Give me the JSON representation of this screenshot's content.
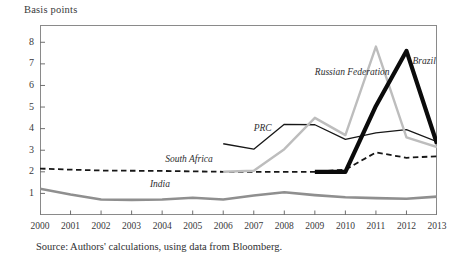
{
  "figure": {
    "y_axis_title": "Basis points",
    "source_note": "Source: Authors' calculations, using data from Bloomberg."
  },
  "chart_data": {
    "type": "line",
    "title": "",
    "subtitle": "",
    "xlabel": "",
    "ylabel": "Basis points",
    "x": [
      2000,
      2001,
      2002,
      2003,
      2004,
      2005,
      2006,
      2007,
      2008,
      2009,
      2010,
      2011,
      2012,
      2013
    ],
    "xtick_labels": [
      "2000",
      "2001",
      "2002",
      "2003",
      "2004",
      "2005",
      "2006",
      "2007",
      "2008",
      "2009",
      "2010",
      "2011",
      "2012",
      "2013"
    ],
    "ytick_labels": [
      "1",
      "2",
      "3",
      "4",
      "5",
      "6",
      "7",
      "8"
    ],
    "yticks": [
      1,
      2,
      3,
      4,
      5,
      6,
      7,
      8
    ],
    "ylim": [
      0,
      8.8
    ],
    "xlim": [
      2000,
      2013
    ],
    "grid": false,
    "legend": "inline-labels",
    "legend_position": "inline",
    "series": [
      {
        "name": "India",
        "label": "India",
        "color": "#8f8f8f",
        "style": "solid",
        "width": 2.6,
        "label_x": 2003.6,
        "label_y": 1.35,
        "x": [
          2000,
          2001,
          2002,
          2003,
          2004,
          2005,
          2006,
          2007,
          2008,
          2009,
          2010,
          2011,
          2012,
          2013
        ],
        "values": [
          1.22,
          0.95,
          0.72,
          0.7,
          0.72,
          0.8,
          0.72,
          0.9,
          1.05,
          0.92,
          0.82,
          0.78,
          0.75,
          0.85
        ]
      },
      {
        "name": "South Africa",
        "label": "South Africa",
        "color": "#171717",
        "style": "dashed",
        "width": 1.8,
        "label_x": 2004.1,
        "label_y": 2.52,
        "x": [
          2000,
          2001,
          2002,
          2003,
          2004,
          2005,
          2006,
          2007,
          2008,
          2009,
          2010,
          2011,
          2012,
          2013
        ],
        "values": [
          2.15,
          2.1,
          2.06,
          2.05,
          2.04,
          2.02,
          2.0,
          2.0,
          2.0,
          2.0,
          2.1,
          2.9,
          2.65,
          2.72
        ]
      },
      {
        "name": "PRC",
        "label": "PRC",
        "color": "#171717",
        "style": "solid",
        "width": 1.3,
        "label_x": 2007.0,
        "label_y": 3.95,
        "x": [
          2006,
          2007,
          2008,
          2009,
          2010,
          2011,
          2012,
          2013
        ],
        "values": [
          3.3,
          3.05,
          4.2,
          4.18,
          3.5,
          3.8,
          3.95,
          3.4
        ]
      },
      {
        "name": "Russian Federation",
        "label": "Russian Federation",
        "color": "#bdbdbd",
        "style": "solid",
        "width": 2.4,
        "label_x": 2009.0,
        "label_y": 6.55,
        "x": [
          2006,
          2007,
          2008,
          2009,
          2010,
          2011,
          2012,
          2013
        ],
        "values": [
          2.0,
          2.05,
          3.05,
          4.5,
          3.7,
          7.8,
          3.6,
          3.15
        ]
      },
      {
        "name": "Brazil",
        "label": "Brazil",
        "color": "#0b0b0b",
        "style": "solid",
        "width": 4.2,
        "label_x": 2012.2,
        "label_y": 7.05,
        "x": [
          2009,
          2010,
          2011,
          2012,
          2013
        ],
        "values": [
          2.0,
          2.0,
          5.05,
          7.6,
          3.3
        ]
      }
    ]
  }
}
